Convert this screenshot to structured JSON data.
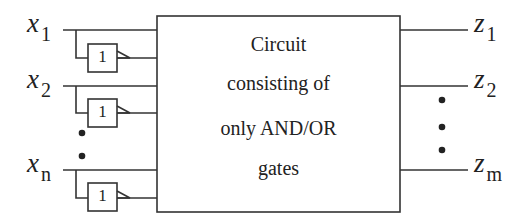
{
  "diagram": {
    "type": "logic-circuit-block",
    "inputs": [
      {
        "var": "x",
        "sub": "1"
      },
      {
        "var": "x",
        "sub": "2"
      },
      {
        "var": "x",
        "sub": "n"
      }
    ],
    "outputs": [
      {
        "var": "z",
        "sub": "1"
      },
      {
        "var": "z",
        "sub": "2"
      },
      {
        "var": "z",
        "sub": "m"
      }
    ],
    "inverter_label": "1",
    "box_lines": [
      "Circuit",
      "consisting of",
      "only AND/OR",
      "gates"
    ],
    "colors": {
      "stroke": "#333333",
      "background": "#ffffff"
    }
  }
}
